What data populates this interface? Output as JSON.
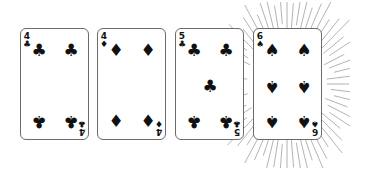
{
  "hand": {
    "cards": [
      {
        "rank": "4",
        "suit": "clubs",
        "glyph": "♣",
        "highlighted": false
      },
      {
        "rank": "4",
        "suit": "diamonds",
        "glyph": "♦",
        "highlighted": false
      },
      {
        "rank": "5",
        "suit": "clubs",
        "glyph": "♣",
        "highlighted": false
      },
      {
        "rank": "6",
        "suit": "spades",
        "glyph": "♠",
        "highlighted": true
      }
    ]
  },
  "colors": {
    "card_border": "#6b6b6b",
    "pip": "#111111",
    "rays": "#9a9a9a"
  }
}
